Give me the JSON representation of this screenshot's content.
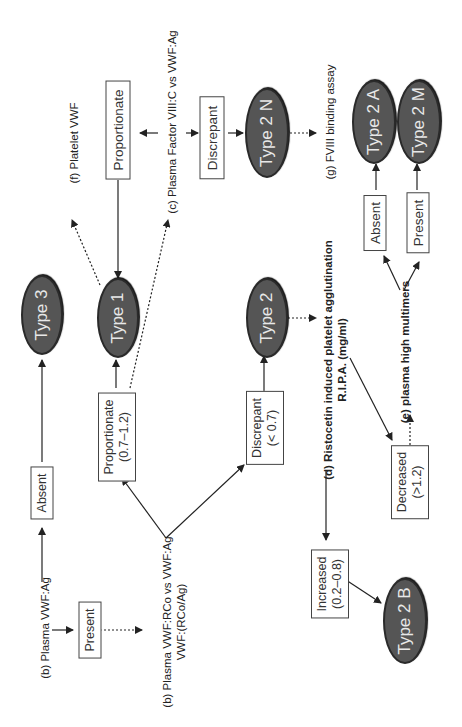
{
  "diagram": {
    "type": "flowchart",
    "orientation": "rotated-90-ccw",
    "steps": {
      "b_plasma_ag": "(b) Plasma VWF:Ag",
      "b_rco_line1": "(b) Plasma VWF:RCo vs VWF:Ag",
      "b_rco_line2": "VWF:(RCo/Ag)",
      "c_factor": "(c) Plasma Factor VIII:C vs VWF:Ag",
      "d_ripa_line1": "(d) Ristocetin induced platelet agglutination",
      "d_ripa_line2": "R.I.P.A. (mg/ml)",
      "e_multimers": "(e)  plasma high multimers",
      "f_platelet": "(f) Platelet VWF",
      "g_fviii": "(g) FVIII binding assay"
    },
    "outcomes": {
      "present": "Present",
      "absent_ag": "Absent",
      "proportionate_ratio_line1": "Proportionate",
      "proportionate_ratio_line2": "(0.7–1.2)",
      "discrepant_ratio_line1": "Discrepant",
      "discrepant_ratio_line2": "(< 0.7)",
      "proportionate_fviii": "Proportionate",
      "discrepant_fviii": "Discrepant",
      "increased_line1": "Increased",
      "increased_line2": "(0.2–0.8)",
      "decreased_line1": "Decreased",
      "decreased_line2": "(>1.2)",
      "multimers_absent": "Absent",
      "multimers_present": "Present"
    },
    "types": {
      "type3": "Type 3",
      "type1": "Type 1",
      "type2": "Type 2",
      "type2n": "Type 2 N",
      "type2a": "Type 2 A",
      "type2m": "Type 2 M",
      "type2b": "Type 2 B"
    },
    "colors": {
      "ellipse_fill": "#555555",
      "ellipse_border": "#2a2a2a",
      "ellipse_text": "#e8e8e8",
      "box_border": "#444444",
      "line": "#222222"
    }
  }
}
